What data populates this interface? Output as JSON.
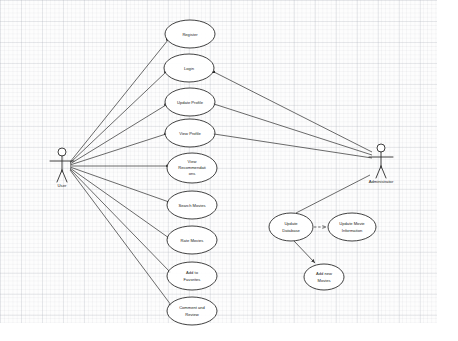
{
  "diagram": {
    "kind": "uml-use-case",
    "background": "#fdfdfd",
    "grid_color": "#aaafb9",
    "stroke_color": "#2b2b2b",
    "ellipse_fill": "#ffffff"
  },
  "actors": [
    {
      "id": "user",
      "label": "User",
      "x": 62,
      "y": 160,
      "side": "left"
    },
    {
      "id": "administrator",
      "label": "Administrator",
      "x": 381,
      "y": 155,
      "side": "right"
    }
  ],
  "use_cases": [
    {
      "id": "register",
      "label": "Register",
      "lines": [
        "Register"
      ],
      "cx": 190,
      "cy": 34,
      "rx": 25,
      "ry": 14
    },
    {
      "id": "login",
      "label": "Login",
      "lines": [
        "Login"
      ],
      "cx": 189,
      "cy": 68,
      "rx": 25,
      "ry": 14
    },
    {
      "id": "update-profile",
      "label": "Update Profile",
      "lines": [
        "Update Profile"
      ],
      "cx": 190,
      "cy": 102,
      "rx": 25,
      "ry": 14
    },
    {
      "id": "view-profile",
      "label": "View Profile",
      "lines": [
        "View Profile"
      ],
      "cx": 190,
      "cy": 133,
      "rx": 25,
      "ry": 14
    },
    {
      "id": "view-recommendations",
      "label": "View Recommendations",
      "lines": [
        "View",
        "Recommendati",
        "ons"
      ],
      "cx": 192,
      "cy": 168,
      "rx": 25,
      "ry": 15
    },
    {
      "id": "search-movies",
      "label": "Search Movies",
      "lines": [
        "Search Movies"
      ],
      "cx": 192,
      "cy": 205,
      "rx": 25,
      "ry": 14
    },
    {
      "id": "rate-movies",
      "label": "Rate Movies",
      "lines": [
        "Rate Movies"
      ],
      "cx": 192,
      "cy": 240,
      "rx": 25,
      "ry": 14
    },
    {
      "id": "add-to-favorites",
      "label": "Add to Favorites",
      "lines": [
        "Add to",
        "Favorites"
      ],
      "cx": 192,
      "cy": 276,
      "rx": 25,
      "ry": 14
    },
    {
      "id": "comment-and-review",
      "label": "Comment and Review",
      "lines": [
        "Comment and",
        "Review"
      ],
      "cx": 192,
      "cy": 311,
      "rx": 25,
      "ry": 14
    },
    {
      "id": "update-database",
      "label": "Update Database",
      "lines": [
        "Update",
        "Database"
      ],
      "cx": 291,
      "cy": 227,
      "rx": 22,
      "ry": 14
    },
    {
      "id": "update-movie-information",
      "label": "Update Movie Information",
      "lines": [
        "Update Movie",
        "Information"
      ],
      "cx": 352,
      "cy": 227,
      "rx": 24,
      "ry": 14
    },
    {
      "id": "add-new-movies",
      "label": "Add new Movies",
      "lines": [
        "Add new",
        "Movies"
      ],
      "cx": 324,
      "cy": 277,
      "rx": 20,
      "ry": 13
    }
  ],
  "associations": [
    {
      "id": "user-register",
      "from": "user",
      "to": "register"
    },
    {
      "id": "user-login",
      "from": "user",
      "to": "login"
    },
    {
      "id": "user-update-profile",
      "from": "user",
      "to": "update-profile"
    },
    {
      "id": "user-view-profile",
      "from": "user",
      "to": "view-profile"
    },
    {
      "id": "user-view-recommendations",
      "from": "user",
      "to": "view-recommendations"
    },
    {
      "id": "user-search-movies",
      "from": "user",
      "to": "search-movies"
    },
    {
      "id": "user-rate-movies",
      "from": "user",
      "to": "rate-movies"
    },
    {
      "id": "user-add-to-favorites",
      "from": "user",
      "to": "add-to-favorites"
    },
    {
      "id": "user-comment-and-review",
      "from": "user",
      "to": "comment-and-review"
    },
    {
      "id": "admin-login",
      "from": "administrator",
      "to": "login"
    },
    {
      "id": "admin-update-profile",
      "from": "administrator",
      "to": "update-profile"
    },
    {
      "id": "admin-view-profile",
      "from": "administrator",
      "to": "view-profile"
    },
    {
      "id": "admin-update-database",
      "from": "administrator",
      "to": "update-database"
    }
  ],
  "dependencies": [
    {
      "id": "updatedb-to-updatemovieinfo",
      "from": "update-database",
      "to": "update-movie-information",
      "style": "dashed"
    }
  ],
  "flows": [
    {
      "id": "updatedb-to-addnewmovies",
      "from": "update-database",
      "to": "add-new-movies",
      "style": "solid"
    }
  ]
}
